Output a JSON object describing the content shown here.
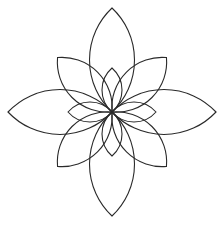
{
  "diagram": {
    "title": "",
    "type": "geometric-flower",
    "canvas": {
      "width": 222,
      "height": 225,
      "background": "#ffffff"
    },
    "center": {
      "x": 112,
      "y": 112
    },
    "stroke": {
      "color": "#2a2a2a",
      "width": 1.1
    },
    "petal_groups": [
      {
        "name": "large-axis-petals",
        "count": 4,
        "angles_deg": [
          0,
          90,
          180,
          270
        ],
        "length": 104,
        "half_width": 22.5
      },
      {
        "name": "diagonal-petals",
        "count": 4,
        "angles_deg": [
          45,
          135,
          225,
          315
        ],
        "length": 77,
        "half_width": 18
      },
      {
        "name": "small-inner-petals",
        "count": 4,
        "angles_deg": [
          0,
          90,
          180,
          270
        ],
        "length": 44,
        "half_width": 10
      }
    ]
  }
}
